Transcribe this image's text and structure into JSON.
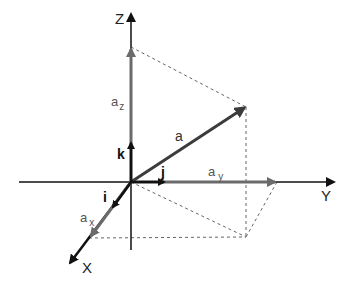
{
  "diagram": {
    "axes": {
      "x_label": "X",
      "y_label": "Y",
      "z_label": "Z"
    },
    "unit_vectors": {
      "i": "i",
      "j": "j",
      "k": "k"
    },
    "vector": {
      "main": "a",
      "x_comp_base": "a",
      "x_comp_sub": "x",
      "y_comp_base": "a",
      "y_comp_sub": "y",
      "z_comp_base": "a",
      "z_comp_sub": "z"
    },
    "colors": {
      "axis": "#111111",
      "component": "#6b6b6b",
      "main_vector": "#3c3c3c",
      "dashed": "#666666",
      "label": "#222222",
      "component_label": "#555555"
    }
  }
}
